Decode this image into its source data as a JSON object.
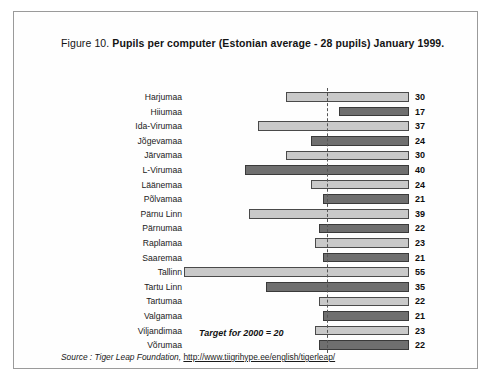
{
  "figure": {
    "number": "Figure 10.",
    "title": "Pupils per computer (Estonian average - 28 pupils) January 1999.",
    "target_caption": "Target for 2000 = 20",
    "source_prefix": "Source : Tiger Leap Foundation,",
    "source_url": "http://www.tiigrihype.ee/english/tigerleap/"
  },
  "colors": {
    "bar_light": "#c9c9c9",
    "bar_dark": "#6f6f6f",
    "bar_outline": "#4a4a4a",
    "frame": "#9a9a9a",
    "target_line": "#555555",
    "text": "#1a1a1a"
  },
  "chart_data": {
    "type": "bar",
    "orientation": "horizontal",
    "direction": "right-to-left",
    "title": "Pupils per computer (Estonian average - 28 pupils) January 1999.",
    "xlabel": "",
    "ylabel": "",
    "xlim": [
      0,
      55
    ],
    "grid": false,
    "legend": "none",
    "annotations": [
      {
        "text": "Target for 2000 = 20",
        "type": "target-line",
        "value": 20
      }
    ],
    "categories": [
      "Harjumaa",
      "Hiiumaa",
      "Ida-Virumaa",
      "Jõgevamaa",
      "Järvamaa",
      "L-Virumaa",
      "Läänemaa",
      "Põlvamaa",
      "Pärnu Linn",
      "Pärnumaa",
      "Raplamaa",
      "Saaremaa",
      "Tallinn",
      "Tartu Linn",
      "Tartumaa",
      "Valgamaa",
      "Viljandimaa",
      "Võrumaa"
    ],
    "values": [
      30,
      17,
      37,
      24,
      30,
      40,
      24,
      21,
      39,
      22,
      23,
      21,
      55,
      35,
      22,
      21,
      23,
      22
    ],
    "shades": [
      "light",
      "dark",
      "light",
      "dark",
      "light",
      "dark",
      "light",
      "dark",
      "light",
      "dark",
      "light",
      "dark",
      "light",
      "dark",
      "light",
      "dark",
      "light",
      "dark"
    ]
  }
}
